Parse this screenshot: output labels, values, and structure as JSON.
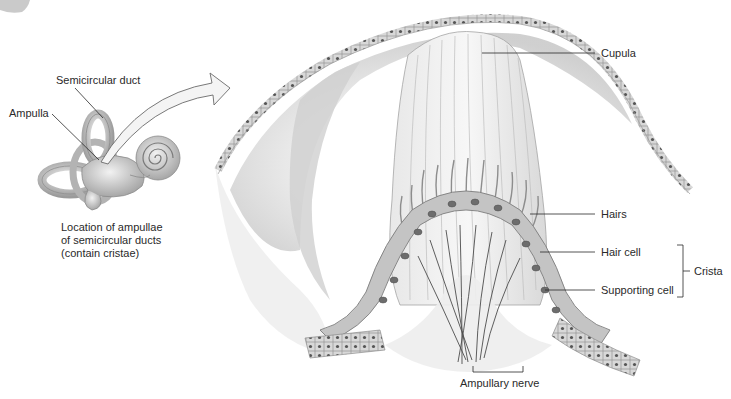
{
  "diagram": {
    "inset": {
      "labels": {
        "semicircular_duct": "Semicircular duct",
        "ampulla": "Ampulla"
      },
      "caption": [
        "Location of ampullae",
        "of semicircular ducts",
        "(contain cristae)"
      ]
    },
    "main": {
      "labels": {
        "cupula": "Cupula",
        "hairs": "Hairs",
        "hair_cell": "Hair cell",
        "supporting_cell": "Supporting cell",
        "crista": "Crista",
        "ampullary_nerve": "Ampullary nerve"
      }
    },
    "colors": {
      "background": "#ffffff",
      "line": "#2a2a2a",
      "tissue_light": "#e4e4e4",
      "tissue_mid": "#b8b8b8",
      "tissue_dark": "#7a7a7a"
    }
  }
}
